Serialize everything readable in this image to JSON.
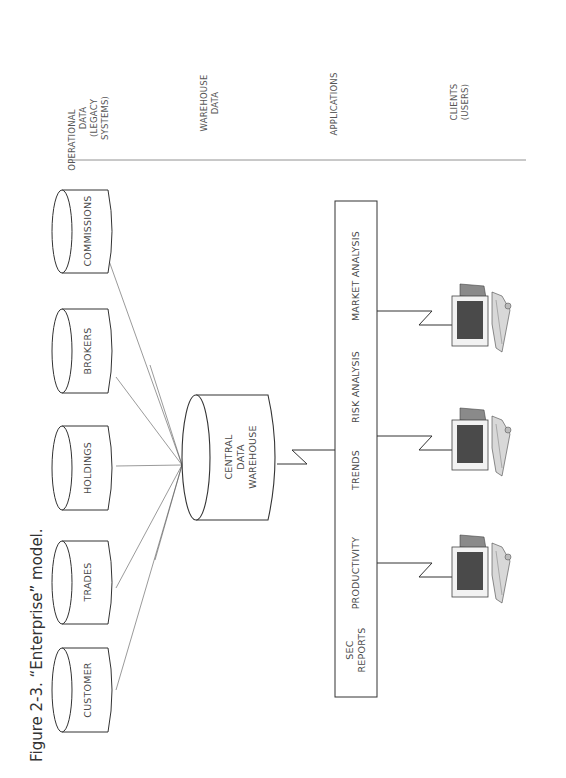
{
  "figure": {
    "caption": "Figure 2-3.  “Enterprise” model.",
    "orientation": "rotated 90 degrees counter-clockwise"
  },
  "columns": [
    {
      "lines": [
        "OPERATIONAL",
        "DATA",
        "(LEGACY",
        "SYSTEMS)"
      ]
    },
    {
      "lines": [
        "WAREHOUSE",
        "DATA"
      ]
    },
    {
      "lines": [
        "APPLICATIONS"
      ]
    },
    {
      "lines": [
        "CLIENTS",
        "(USERS)"
      ]
    }
  ],
  "sources": [
    {
      "label": "COMMISSIONS"
    },
    {
      "label": "BROKERS"
    },
    {
      "label": "HOLDINGS"
    },
    {
      "label": "TRADES"
    },
    {
      "label": "CUSTOMER"
    }
  ],
  "warehouse": {
    "lines": [
      "CENTRAL",
      "DATA",
      "WAREHOUSE"
    ]
  },
  "applications": [
    {
      "lines": [
        "MARKET ANALYSIS"
      ]
    },
    {
      "lines": [
        "RISK ANALYSIS"
      ]
    },
    {
      "lines": [
        "TRENDS"
      ]
    },
    {
      "lines": [
        "PRODUCTIVITY"
      ]
    },
    {
      "lines": [
        "SEC",
        "REPORTS"
      ]
    }
  ],
  "clients": [
    {
      "icon": "computer-workstation-icon"
    },
    {
      "icon": "computer-workstation-icon"
    },
    {
      "icon": "computer-workstation-icon"
    }
  ],
  "colors": {
    "line": "#3a3a3a",
    "screen": "#4a4a4a",
    "case": "#8a8a8a",
    "background": "#ffffff"
  }
}
